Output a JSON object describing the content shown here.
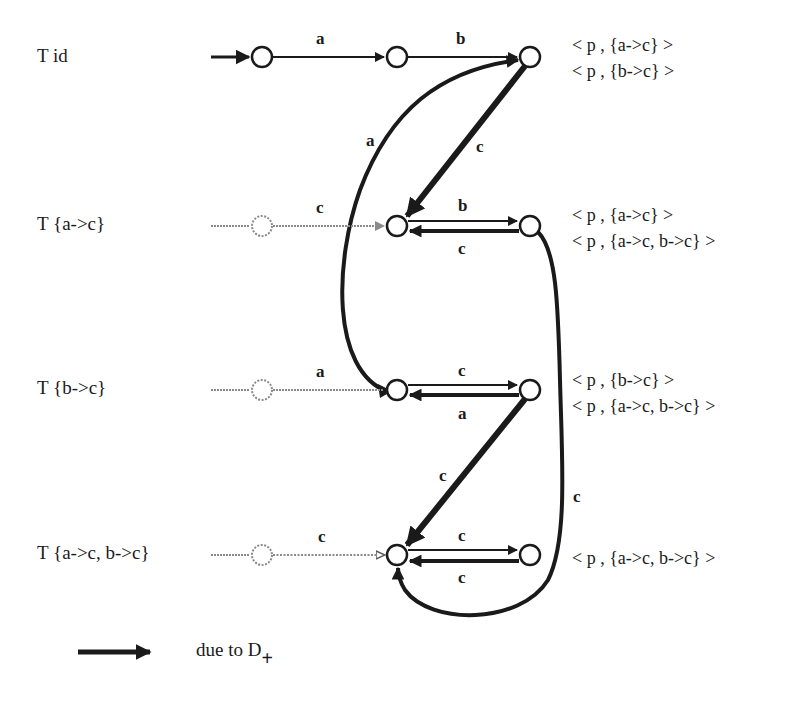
{
  "rows": [
    {
      "label": "T id",
      "states": [
        "< p , {a->c} >",
        "< p , {b->c} >"
      ]
    },
    {
      "label": "T {a->c}",
      "states": [
        "< p , {a->c} >",
        "< p , {a->c, b->c} >"
      ]
    },
    {
      "label": "T {b->c}",
      "states": [
        "< p , {b->c} >",
        "< p , {a->c, b->c} >"
      ]
    },
    {
      "label": "T {a->c, b->c}",
      "states": [
        "< p , {a->c, b->c} >"
      ]
    }
  ],
  "edges": {
    "r1_a": "a",
    "r1_b": "b",
    "curve_a": "a",
    "diag_c1": "c",
    "r2_in_c": "c",
    "r2_b": "b",
    "r2_c": "c",
    "r3_in_a": "a",
    "r3_c": "c",
    "r3_a": "a",
    "diag_c2": "c",
    "loop_c": "c",
    "r4_in_c": "c",
    "r4_c_top": "c",
    "r4_c_bottom": "c"
  },
  "legend": {
    "text": "due to D",
    "subscript": "+"
  },
  "colors": {
    "ink": "#1a1a1a",
    "ghost": "#7a7a7a",
    "background": "#ffffff"
  }
}
